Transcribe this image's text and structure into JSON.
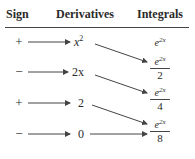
{
  "table": {
    "headers": {
      "sign": "Sign",
      "derivatives": "Derivatives",
      "integrals": "Integrals"
    },
    "rows": [
      {
        "sign": "+",
        "derivative_base": "x",
        "derivative_exp": "2",
        "integral_num_base": "e",
        "integral_num_exp": "2x",
        "integral_den": ""
      },
      {
        "sign": "−",
        "derivative_base": "2x",
        "derivative_exp": "",
        "integral_num_base": "e",
        "integral_num_exp": "2x",
        "integral_den": "2"
      },
      {
        "sign": "+",
        "derivative_base": "2",
        "derivative_exp": "",
        "integral_num_base": "e",
        "integral_num_exp": "2x",
        "integral_den": "4"
      },
      {
        "sign": "−",
        "derivative_base": "0",
        "derivative_exp": "",
        "integral_num_base": "e",
        "integral_num_exp": "2x",
        "integral_den": "8"
      }
    ]
  },
  "colors": {
    "text": "#2a2a2a",
    "lines": "#444444",
    "background": "#ffffff"
  }
}
